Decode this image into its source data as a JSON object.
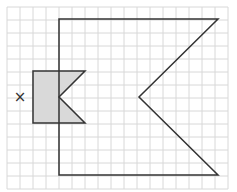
{
  "diagram": {
    "type": "grid-transformation",
    "grid": {
      "cell_size": 13,
      "origin_x": 7,
      "origin_y": 7,
      "cols": 17,
      "rows": 14,
      "line_color": "#d8d8d8"
    },
    "large_shape": {
      "description": "Enlarged arrow/flag shape (outline only)",
      "points": [
        [
          59,
          19
        ],
        [
          218,
          19
        ],
        [
          139,
          97
        ],
        [
          218,
          175
        ],
        [
          59,
          175
        ]
      ],
      "stroke": "#333333"
    },
    "small_shape": {
      "description": "Original shaded arrow/flag shape",
      "points": [
        [
          33,
          71
        ],
        [
          85,
          71
        ],
        [
          59,
          97
        ],
        [
          85,
          123
        ],
        [
          33,
          123
        ]
      ],
      "fill": "#d9d9d9",
      "stroke": "#333333"
    },
    "center_marker": {
      "label": "×",
      "x": 20,
      "y": 97
    }
  }
}
